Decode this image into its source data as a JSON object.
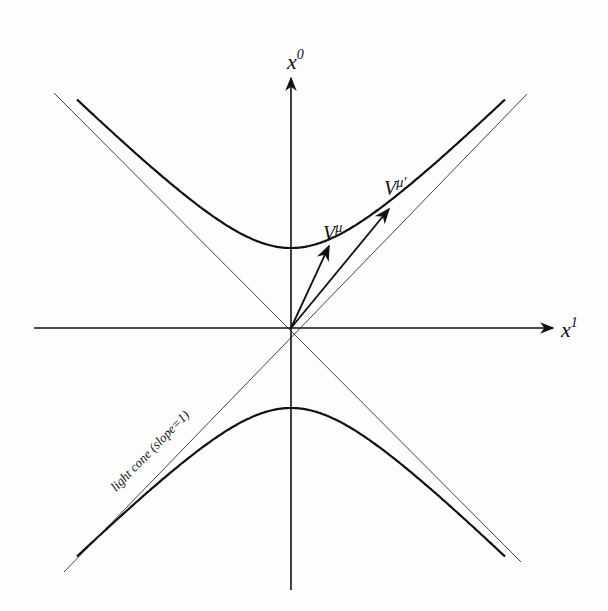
{
  "diagram": {
    "type": "spacetime-diagram",
    "axes": {
      "vertical": {
        "label_base": "x",
        "label_sup": "0"
      },
      "horizontal": {
        "label_base": "x",
        "label_sup": "1"
      }
    },
    "vectors": [
      {
        "label_base": "V",
        "label_sup": "μ"
      },
      {
        "label_base": "V",
        "label_sup": "μ'"
      }
    ],
    "light_cone_label": "light cone (slope=1)",
    "curves": [
      "upper hyperbola branch",
      "lower hyperbola branch",
      "light cone line x0=x1",
      "light cone line x0=-x1"
    ],
    "colors": {
      "ink": "#111111",
      "thin_line": "#444444",
      "background": "#fdfdfd"
    }
  }
}
